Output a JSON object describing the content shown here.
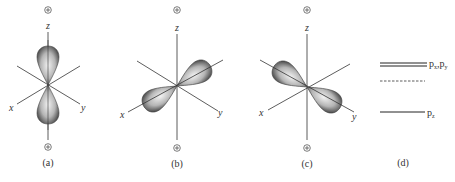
{
  "figure": {
    "panels": [
      {
        "id": "a",
        "caption": "(a)",
        "top_sign": "+",
        "bottom_sign": "+",
        "axes": {
          "z": "z",
          "x": "x",
          "y": "y"
        },
        "lobe_axis": "z"
      },
      {
        "id": "b",
        "caption": "(b)",
        "top_sign": "+",
        "bottom_sign": "+",
        "axes": {
          "z": "z",
          "x": "x",
          "y": "y"
        },
        "lobe_axis": "x"
      },
      {
        "id": "c",
        "caption": "(c)",
        "top_sign": "+",
        "bottom_sign": "+",
        "axes": {
          "z": "z",
          "x": "x",
          "y": "y"
        },
        "lobe_axis": "y"
      },
      {
        "id": "d",
        "caption": "(d)"
      }
    ],
    "energy_levels": [
      {
        "label": "p",
        "subscript": "x",
        "label2": "p",
        "subscript2": "y",
        "separator": ",",
        "style": "double"
      },
      {
        "label": "",
        "style": "dashed"
      },
      {
        "label": "p",
        "subscript": "z",
        "style": "solid"
      }
    ],
    "colors": {
      "line": "#333333",
      "lobe_dark": "#3a3a3a",
      "lobe_light": "#e8e8e8"
    }
  }
}
